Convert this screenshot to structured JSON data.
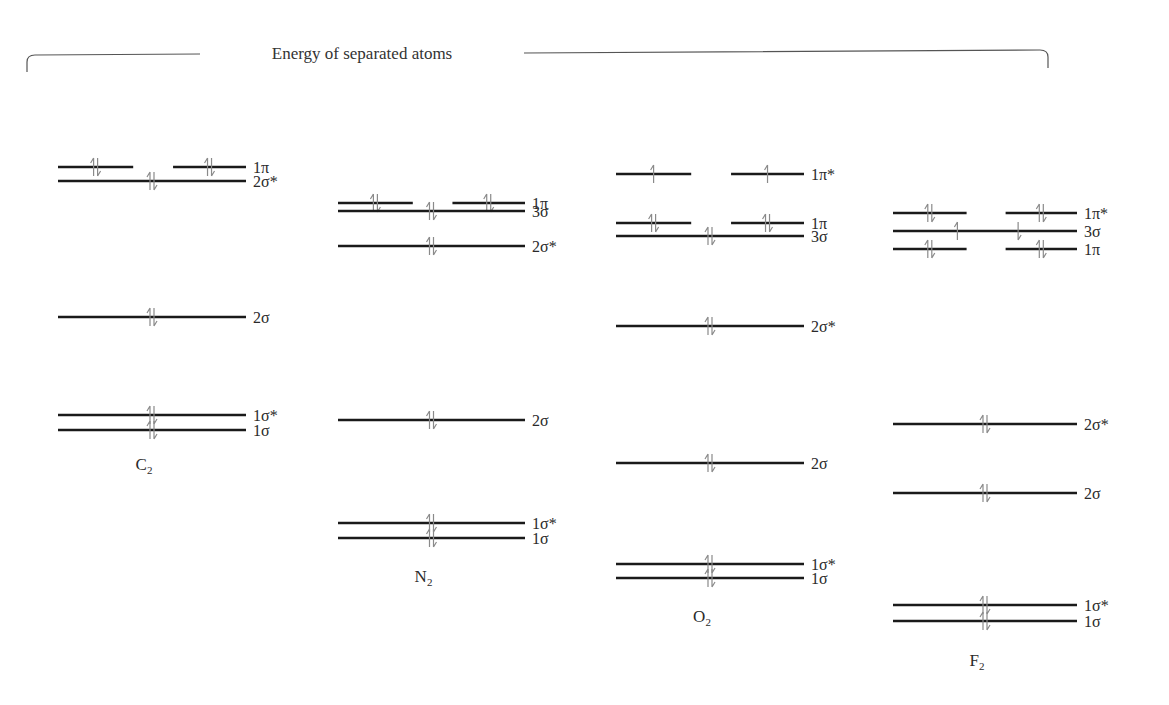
{
  "diagram": {
    "title": "Energy of separated atoms",
    "type": "molecular-orbital-energy-level-diagram",
    "molecules": [
      {
        "name": "C",
        "subscript": "2",
        "x0": 58,
        "x1": 246,
        "label_y": 470,
        "levels": [
          {
            "label": "1π",
            "y": 167,
            "split": true,
            "electrons": "paired-both"
          },
          {
            "label": "2σ*",
            "y": 181,
            "split": false,
            "electrons": "paired"
          },
          {
            "label": "2σ",
            "y": 317,
            "split": false,
            "electrons": "paired"
          },
          {
            "label": "1σ*",
            "y": 415,
            "split": false,
            "electrons": "paired"
          },
          {
            "label": "1σ",
            "y": 430,
            "split": false,
            "electrons": "paired"
          }
        ]
      },
      {
        "name": "N",
        "subscript": "2",
        "x0": 338,
        "x1": 525,
        "label_y": 582,
        "levels": [
          {
            "label": "1π",
            "y": 203,
            "split": true,
            "electrons": "paired-both"
          },
          {
            "label": "3σ",
            "y": 211,
            "split": false,
            "electrons": "paired"
          },
          {
            "label": "2σ*",
            "y": 246,
            "split": false,
            "electrons": "paired"
          },
          {
            "label": "2σ",
            "y": 420,
            "split": false,
            "electrons": "paired"
          },
          {
            "label": "1σ*",
            "y": 523,
            "split": false,
            "electrons": "paired"
          },
          {
            "label": "1σ",
            "y": 538,
            "split": false,
            "electrons": "paired"
          }
        ]
      },
      {
        "name": "O",
        "subscript": "2",
        "x0": 616,
        "x1": 804,
        "label_y": 622,
        "levels": [
          {
            "label": "1π*",
            "y": 174,
            "split": true,
            "electrons": "single-both"
          },
          {
            "label": "1π",
            "y": 223,
            "split": true,
            "electrons": "paired-both"
          },
          {
            "label": "3σ",
            "y": 236,
            "split": false,
            "electrons": "paired"
          },
          {
            "label": "2σ*",
            "y": 326,
            "split": false,
            "electrons": "paired"
          },
          {
            "label": "2σ",
            "y": 463,
            "split": false,
            "electrons": "paired"
          },
          {
            "label": "1σ*",
            "y": 564,
            "split": false,
            "electrons": "paired"
          },
          {
            "label": "1σ",
            "y": 578,
            "split": false,
            "electrons": "paired"
          }
        ]
      },
      {
        "name": "F",
        "subscript": "2",
        "x0": 893,
        "x1": 1077,
        "label_y": 666,
        "levels": [
          {
            "label": "1π*",
            "y": 213,
            "split": true,
            "electrons": "paired-both"
          },
          {
            "label": "3σ",
            "y": 231,
            "split": false,
            "electrons": "up-down-separated"
          },
          {
            "label": "1π",
            "y": 249,
            "split": true,
            "electrons": "paired-both"
          },
          {
            "label": "2σ*",
            "y": 424,
            "split": false,
            "electrons": "paired"
          },
          {
            "label": "2σ",
            "y": 493,
            "split": false,
            "electrons": "paired"
          },
          {
            "label": "1σ*",
            "y": 605,
            "split": false,
            "electrons": "paired"
          },
          {
            "label": "1σ",
            "y": 621,
            "split": false,
            "electrons": "paired"
          }
        ]
      }
    ]
  }
}
